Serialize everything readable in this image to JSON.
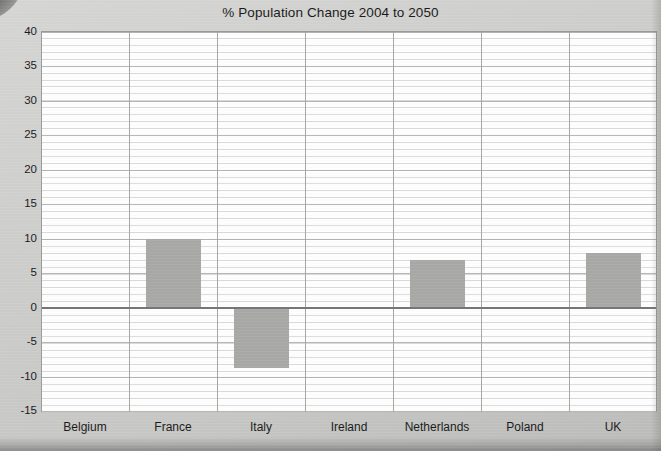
{
  "chart_data": {
    "type": "bar",
    "title": "% Population Change 2004 to 2050",
    "xlabel": "",
    "ylabel": "",
    "categories": [
      "Belgium",
      "France",
      "Italy",
      "Ireland",
      "Netherlands",
      "Poland",
      "UK"
    ],
    "values": [
      0,
      10,
      -8.7,
      0,
      6.9,
      0,
      8
    ],
    "ylim": [
      -15,
      40
    ],
    "ytick_labels": [
      "40",
      "35",
      "30",
      "25",
      "20",
      "15",
      "10",
      "5",
      "0",
      "-5",
      "-10",
      "-15"
    ],
    "ytick_values": [
      40,
      35,
      30,
      25,
      20,
      15,
      10,
      5,
      0,
      -5,
      -10,
      -15
    ],
    "ytick_step": 5,
    "minor_grid_step": 1,
    "grid": true,
    "legend": "none",
    "bar_color": "#a9a9a7",
    "zero_line_color": "#77777a",
    "grid_color": "#dcdcdc",
    "major_grid_color": "#b4b4b2",
    "plot_background": "#ffffff",
    "page_background": "#cdcdcb",
    "text_color": "#1b1b1b"
  }
}
